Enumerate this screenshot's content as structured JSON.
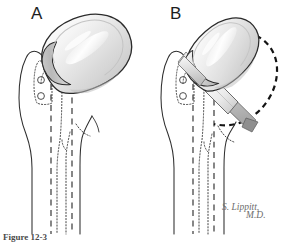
{
  "figure": {
    "signature": {
      "line1": "S. Lippitt,",
      "line2": "M.D."
    },
    "caption_partial": "Figure 12-3"
  },
  "panels": [
    {
      "letter": "A",
      "name": "panel-a",
      "description": "Proximal humerus with oversized humeral head prosthesis seated on the cut surface"
    },
    {
      "letter": "B",
      "name": "panel-b",
      "description": "Proximal humerus with prosthesis and osteotomy plane; dashed circle marks the original anatomic head contour"
    }
  ],
  "colors": {
    "outline": "#2b2b2b",
    "bone_line": "#2f2f2f",
    "implant_fill_light": "#f3f3f3",
    "implant_fill_mid": "#d9d9d9",
    "implant_fill_dark": "#b4b4b4",
    "implant_rim": "#c9c9c9",
    "highlight": "#ffffff",
    "signature_color": "#6d6d6d",
    "background": "#ffffff",
    "dashed_circle": "#1a1a1a"
  },
  "annotations": {
    "tuberosity_holes": 2,
    "canal_lines": "dashed and dotted cortical / medullary canal markings"
  }
}
